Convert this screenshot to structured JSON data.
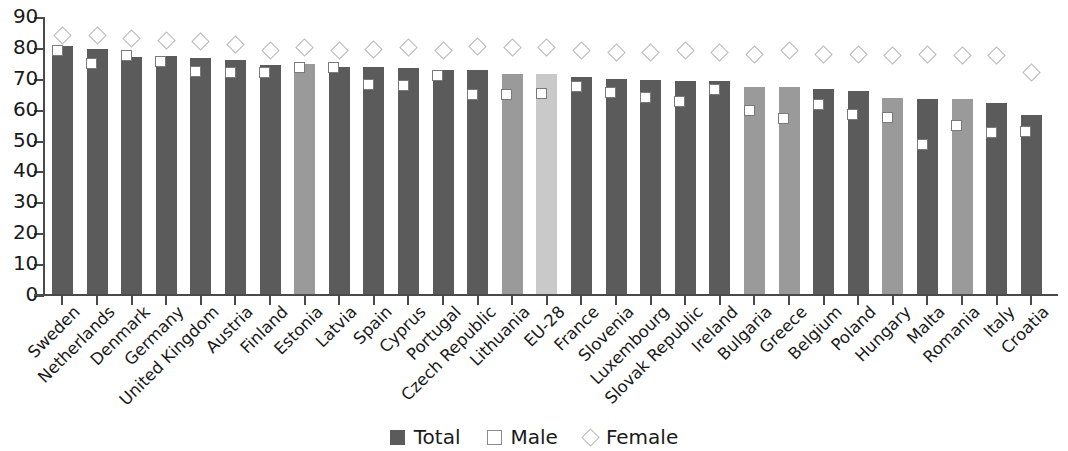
{
  "chart_data": {
    "type": "bar",
    "title": "",
    "subtitle": "",
    "xlabel": "",
    "ylabel": "",
    "ylim": [
      0,
      90
    ],
    "yticks": [
      0,
      10,
      20,
      30,
      40,
      50,
      60,
      70,
      80,
      90
    ],
    "grid": false,
    "legend_position": "bottom-center",
    "categories": [
      "Sweden",
      "Netherlands",
      "Denmark",
      "Germany",
      "United Kingdom",
      "Austria",
      "Finland",
      "Estonia",
      "Latvia",
      "Spain",
      "Cyprus",
      "Portugal",
      "Czech Republic",
      "Lithuania",
      "EU-28",
      "France",
      "Slovenia",
      "Luxembourg",
      "Slovak Republic",
      "Ireland",
      "Bulgaria",
      "Greece",
      "Belgium",
      "Poland",
      "Hungary",
      "Malta",
      "Romania",
      "Italy",
      "Croatia"
    ],
    "series": [
      {
        "name": "Total",
        "type": "bar",
        "values": [
          80.5,
          79.5,
          77.0,
          77.3,
          76.6,
          76.0,
          74.5,
          74.8,
          73.8,
          73.8,
          73.5,
          72.8,
          72.8,
          71.5,
          71.5,
          70.6,
          69.8,
          69.5,
          69.2,
          69.2,
          67.3,
          67.2,
          66.6,
          66.0,
          63.9,
          63.6,
          63.6,
          62.2,
          58.2
        ]
      },
      {
        "name": "Male",
        "type": "marker-square",
        "values": [
          79.0,
          75.0,
          77.5,
          75.5,
          72.2,
          72.1,
          72.0,
          73.5,
          73.5,
          68.0,
          67.8,
          71.0,
          64.8,
          65.0,
          65.2,
          67.5,
          65.5,
          64.0,
          62.5,
          66.6,
          59.8,
          57.3,
          61.8,
          58.3,
          57.5,
          48.8,
          55.0,
          52.5,
          53.0
        ]
      },
      {
        "name": "Female",
        "type": "marker-diamond",
        "values": [
          84.0,
          84.0,
          83.0,
          82.5,
          82.0,
          81.0,
          79.0,
          80.0,
          79.0,
          79.5,
          80.0,
          79.0,
          80.5,
          80.0,
          80.0,
          79.0,
          78.5,
          78.5,
          79.0,
          78.5,
          78.0,
          79.0,
          78.0,
          78.0,
          77.5,
          78.0,
          77.5,
          77.5,
          72.0
        ]
      }
    ],
    "bar_tones": [
      "dark",
      "dark",
      "dark",
      "dark",
      "dark",
      "dark",
      "dark",
      "mid",
      "dark",
      "dark",
      "dark",
      "dark",
      "dark",
      "mid",
      "light",
      "dark",
      "dark",
      "dark",
      "dark",
      "dark",
      "mid",
      "mid",
      "dark",
      "dark",
      "mid",
      "dark",
      "mid",
      "dark",
      "dark"
    ],
    "colors": {
      "total_dark": "#5b5b5b",
      "total_mid": "#9a9a9a",
      "total_light": "#c9c9c9",
      "male_fill": "#ffffff",
      "male_border": "#7a7a7a",
      "female_border": "#b9b9b9",
      "axis": "#4a4a4a",
      "text": "#1a1a1a"
    }
  },
  "legend": {
    "items": [
      {
        "label": "Total",
        "swatch": "filled-square-icon"
      },
      {
        "label": "Male",
        "swatch": "open-square-icon"
      },
      {
        "label": "Female",
        "swatch": "open-diamond-icon"
      }
    ]
  }
}
